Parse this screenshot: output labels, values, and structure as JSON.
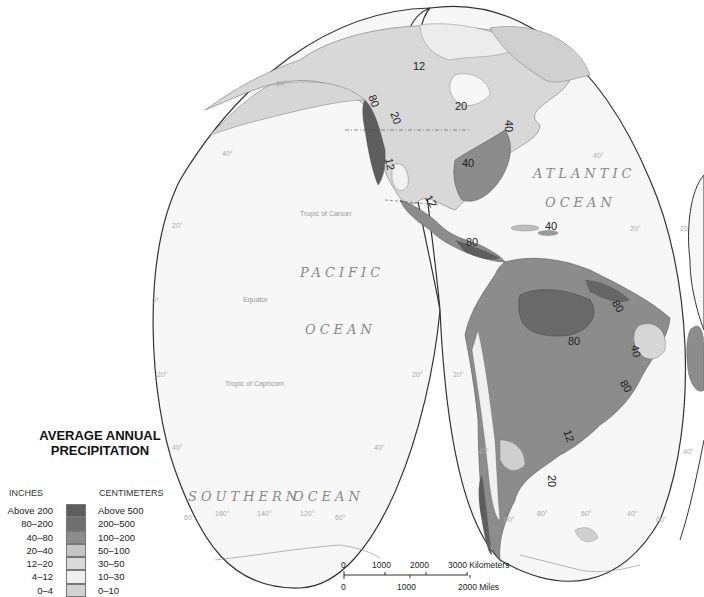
{
  "legend": {
    "title_line1": "AVERAGE ANNUAL",
    "title_line2": "PRECIPITATION",
    "inches_header": "INCHES",
    "cm_header": "CENTIMETERS",
    "classes": [
      {
        "inches": "Above 200",
        "cm": "Above 500",
        "color": "#5e5e5e"
      },
      {
        "inches": "80–200",
        "cm": "200–500",
        "color": "#6f6f6f"
      },
      {
        "inches": "40–80",
        "cm": "100–200",
        "color": "#8c8c8c"
      },
      {
        "inches": "20–40",
        "cm": "50–100",
        "color": "#c6c6c6"
      },
      {
        "inches": "12–20",
        "cm": "30–50",
        "color": "#dadada"
      },
      {
        "inches": "4–12",
        "cm": "10–30",
        "color": "#efefef"
      },
      {
        "inches": "0–4",
        "cm": "0–10",
        "color": "#d2d2d2"
      }
    ]
  },
  "ocean_labels": {
    "pacific_1": "PACIFIC",
    "pacific_2": "OCEAN",
    "atlantic_1": "ATLANTIC",
    "atlantic_2": "OCEAN",
    "southern_1": "SOUTHERN",
    "southern_2": "OCEAN"
  },
  "reference_lines": {
    "tropic_cancer": "Tropic of Cancer",
    "equator": "Equator",
    "tropic_capricorn": "Tropic of Capricorn"
  },
  "degree_labels": {
    "lat60_nw": "60°",
    "lat40_w": "40°",
    "lat20_w": "20°",
    "lat0_w": "0°",
    "lat20s_w": "20°",
    "lat40s_w": "40°",
    "lat60s_w": "60°",
    "lon160": "160°",
    "lon140": "140°",
    "lon120": "120°",
    "lat60s_mid": "60°",
    "lat20s_mid_l": "20°",
    "lat20s_mid_r": "20°",
    "lat40s_mid_l": "40°",
    "lat40_e": "40°",
    "lat20_e": "20°",
    "lat20_far": "20°",
    "lat40s_e": "40°",
    "lat40s_far": "40°",
    "lat60s_s1": "60°",
    "lon80": "80°",
    "lon60": "60°",
    "lon40": "40°",
    "lat60s_s2": "60°"
  },
  "isohyet_labels": [
    "12",
    "20",
    "20",
    "40",
    "40",
    "80",
    "12",
    "12",
    "40",
    "80",
    "80",
    "40",
    "80",
    "12",
    "80",
    "20"
  ],
  "scale_bar": {
    "km_ticks": [
      "0",
      "1000",
      "2000",
      "3000 Kilometers"
    ],
    "mi_ticks": [
      "0",
      "1000",
      "2000 Miles"
    ]
  }
}
